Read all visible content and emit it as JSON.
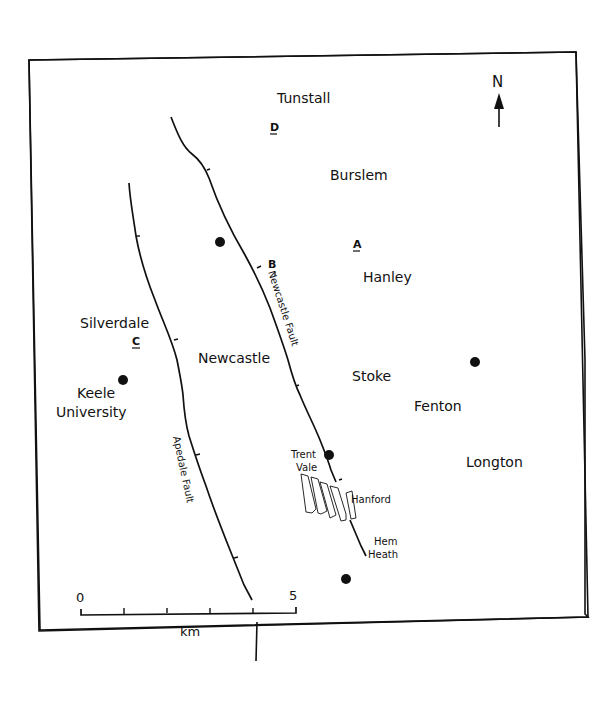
{
  "map": {
    "north_label": "N",
    "towns": [
      {
        "name": "Tunstall",
        "x": 277,
        "y": 103
      },
      {
        "name": "Burslem",
        "x": 330,
        "y": 180
      },
      {
        "name": "Hanley",
        "x": 363,
        "y": 282
      },
      {
        "name": "Silverdale",
        "x": 80,
        "y": 328
      },
      {
        "name": "Newcastle",
        "x": 198,
        "y": 363
      },
      {
        "name": "Stoke",
        "x": 352,
        "y": 381
      },
      {
        "name": "Keele",
        "x": 77,
        "y": 398
      },
      {
        "name": "University",
        "x": 56,
        "y": 417
      },
      {
        "name": "Fenton",
        "x": 414,
        "y": 411
      },
      {
        "name": "Longton",
        "x": 466,
        "y": 467
      }
    ],
    "small_labels": [
      {
        "name": "Trent",
        "x": 291,
        "y": 458
      },
      {
        "name": "Vale",
        "x": 296,
        "y": 471
      },
      {
        "name": "Hanford",
        "x": 351,
        "y": 503
      },
      {
        "name": "Hem",
        "x": 374,
        "y": 545
      },
      {
        "name": "Heath",
        "x": 368,
        "y": 558
      }
    ],
    "site_letters": [
      "D",
      "A",
      "B",
      "C"
    ],
    "faults": [
      {
        "name": "Newcastle Fault"
      },
      {
        "name": "Apedale Fault"
      }
    ],
    "scale_bar": {
      "start_label": "0",
      "end_label": "5",
      "unit": "km"
    }
  }
}
